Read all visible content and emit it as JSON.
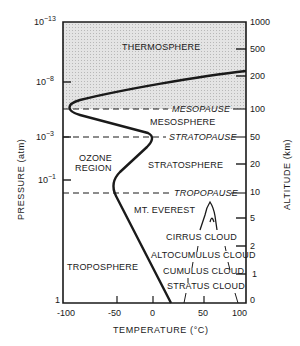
{
  "diagram": {
    "x_axis": {
      "label": "TEMPERATURE (°C)",
      "ticks": [
        "-100",
        "-50",
        "0",
        "50",
        "100"
      ]
    },
    "left_axis": {
      "label": "PRESSURE (atm)",
      "ticks": [
        {
          "base": "10",
          "exp": "−13"
        },
        {
          "base": "10",
          "exp": "−8"
        },
        {
          "base": "10",
          "exp": "−3"
        },
        {
          "base": "10",
          "exp": "−1"
        },
        {
          "base": "1",
          "exp": ""
        }
      ]
    },
    "right_axis": {
      "label": "ALTITUDE (km)",
      "ticks": [
        "1000",
        "500",
        "200",
        "100",
        "50",
        "20",
        "10",
        "5",
        "2",
        "1",
        "0"
      ]
    },
    "regions": {
      "thermosphere": "THERMOSPHERE",
      "mesosphere": "MESOSPHERE",
      "stratosphere": "STRATOSPHERE",
      "troposphere": "TROPOSPHERE",
      "ozone_line1": "OZONE",
      "ozone_line2": "REGION"
    },
    "boundaries": {
      "mesopause": "MESOPAUSE",
      "stratopause": "STRATOPAUSE",
      "tropopause": "TROPOPAUSE"
    },
    "features": {
      "everest": "MT. EVEREST",
      "cirrus": "CIRRUS CLOUD",
      "altocumulus": "ALTOCUMULUS CLOUD",
      "cumulus": "CUMULUS CLOUD",
      "stratus": "STRATUS CLOUD"
    },
    "colors": {
      "ink": "#1a1a1a",
      "thermosphere_fill": "#d9d9d9"
    }
  }
}
